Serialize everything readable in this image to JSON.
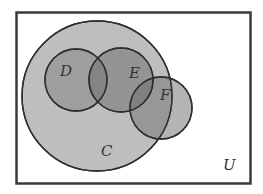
{
  "diagram": {
    "type": "venn",
    "universe": {
      "label": "U"
    },
    "sets": [
      {
        "id": "C",
        "label": "C",
        "fill": "#bdbdbd"
      },
      {
        "id": "D",
        "label": "D",
        "fill": "#8f8f8f"
      },
      {
        "id": "E",
        "label": "E",
        "fill": "#7f7f7f"
      },
      {
        "id": "F",
        "label": "F",
        "fill": "#9a9a9a"
      }
    ],
    "relations": [
      "D is a subset of C",
      "E is a subset of C",
      "D and E overlap",
      "E and F overlap",
      "F partially overlaps C"
    ],
    "colors": {
      "outline": "#333333",
      "background": "#ffffff"
    }
  }
}
